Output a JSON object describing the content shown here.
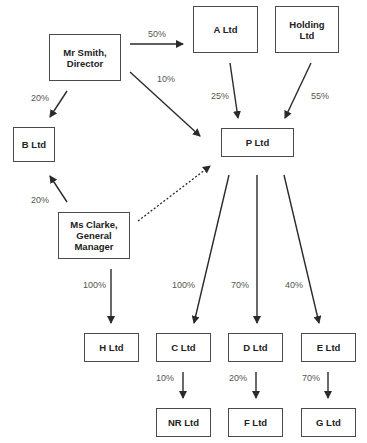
{
  "diagram": {
    "type": "ownership-structure",
    "nodes": [
      {
        "id": "smith",
        "lines": [
          "Mr Smith,",
          "Director"
        ],
        "x": 49,
        "y": 34,
        "w": 72,
        "h": 47
      },
      {
        "id": "a",
        "lines": [
          "A Ltd"
        ],
        "x": 193,
        "y": 6,
        "w": 65,
        "h": 47
      },
      {
        "id": "holding",
        "lines": [
          "Holding",
          "Ltd"
        ],
        "x": 275,
        "y": 6,
        "w": 64,
        "h": 47
      },
      {
        "id": "b",
        "lines": [
          "B Ltd"
        ],
        "x": 13,
        "y": 127,
        "w": 42,
        "h": 35
      },
      {
        "id": "p",
        "lines": [
          "P Ltd"
        ],
        "x": 221,
        "y": 128,
        "w": 73,
        "h": 29
      },
      {
        "id": "clarke",
        "lines": [
          "Ms Clarke,",
          "General",
          "Manager"
        ],
        "x": 58,
        "y": 212,
        "w": 72,
        "h": 47
      },
      {
        "id": "h",
        "lines": [
          "H Ltd"
        ],
        "x": 84,
        "y": 333,
        "w": 55,
        "h": 29
      },
      {
        "id": "c",
        "lines": [
          "C Ltd"
        ],
        "x": 156,
        "y": 333,
        "w": 55,
        "h": 29
      },
      {
        "id": "d",
        "lines": [
          "D Ltd"
        ],
        "x": 228,
        "y": 333,
        "w": 55,
        "h": 29
      },
      {
        "id": "e",
        "lines": [
          "E Ltd"
        ],
        "x": 301,
        "y": 333,
        "w": 55,
        "h": 29
      },
      {
        "id": "nr",
        "lines": [
          "NR Ltd"
        ],
        "x": 156,
        "y": 408,
        "w": 55,
        "h": 29
      },
      {
        "id": "f",
        "lines": [
          "F Ltd"
        ],
        "x": 228,
        "y": 408,
        "w": 55,
        "h": 29
      },
      {
        "id": "g",
        "lines": [
          "G Ltd"
        ],
        "x": 301,
        "y": 408,
        "w": 55,
        "h": 29
      }
    ],
    "edges": [
      {
        "from": "smith",
        "to": "a",
        "label": "50%",
        "x1": 130,
        "y1": 44,
        "x2": 183,
        "y2": 44,
        "lx": 148,
        "ly": 29,
        "dashed": false
      },
      {
        "from": "smith",
        "to": "p",
        "label": "10%",
        "x1": 130,
        "y1": 72,
        "x2": 200,
        "y2": 136,
        "lx": 157,
        "ly": 74,
        "dashed": false
      },
      {
        "from": "smith",
        "to": "b",
        "label": "20%",
        "x1": 67,
        "y1": 91,
        "x2": 50,
        "y2": 117,
        "lx": 31,
        "ly": 93,
        "dashed": false
      },
      {
        "from": "a",
        "to": "p",
        "label": "25%",
        "x1": 230,
        "y1": 63,
        "x2": 238,
        "y2": 118,
        "lx": 211,
        "ly": 91,
        "dashed": false
      },
      {
        "from": "holding",
        "to": "p",
        "label": "55%",
        "x1": 311,
        "y1": 63,
        "x2": 285,
        "y2": 118,
        "lx": 311,
        "ly": 91,
        "dashed": false
      },
      {
        "from": "clarke",
        "to": "b",
        "label": "20%",
        "x1": 67,
        "y1": 202,
        "x2": 50,
        "y2": 176,
        "lx": 31,
        "ly": 195,
        "dashed": false
      },
      {
        "from": "clarke",
        "to": "p",
        "label": "",
        "x1": 138,
        "y1": 221,
        "x2": 210,
        "y2": 166,
        "lx": 0,
        "ly": 0,
        "dashed": true
      },
      {
        "from": "clarke",
        "to": "h",
        "label": "100%",
        "x1": 111,
        "y1": 269,
        "x2": 111,
        "y2": 323,
        "lx": 83,
        "ly": 280,
        "dashed": false
      },
      {
        "from": "p",
        "to": "c",
        "label": "100%",
        "x1": 229,
        "y1": 175,
        "x2": 194,
        "y2": 323,
        "lx": 172,
        "ly": 280,
        "dashed": false
      },
      {
        "from": "p",
        "to": "d",
        "label": "70%",
        "x1": 257,
        "y1": 175,
        "x2": 257,
        "y2": 323,
        "lx": 231,
        "ly": 280,
        "dashed": false
      },
      {
        "from": "p",
        "to": "e",
        "label": "40%",
        "x1": 284,
        "y1": 175,
        "x2": 319,
        "y2": 323,
        "lx": 285,
        "ly": 280,
        "dashed": false
      },
      {
        "from": "c",
        "to": "nr",
        "label": "10%",
        "x1": 183,
        "y1": 372,
        "x2": 183,
        "y2": 398,
        "lx": 156,
        "ly": 373,
        "dashed": false
      },
      {
        "from": "d",
        "to": "f",
        "label": "20%",
        "x1": 256,
        "y1": 372,
        "x2": 256,
        "y2": 398,
        "lx": 229,
        "ly": 373,
        "dashed": false
      },
      {
        "from": "e",
        "to": "g",
        "label": "70%",
        "x1": 328,
        "y1": 372,
        "x2": 328,
        "y2": 398,
        "lx": 302,
        "ly": 373,
        "dashed": false
      }
    ],
    "colors": {
      "line": "#2a2a2a",
      "border": "#4a4a4a",
      "label": "#555555",
      "text": "#222222"
    }
  }
}
